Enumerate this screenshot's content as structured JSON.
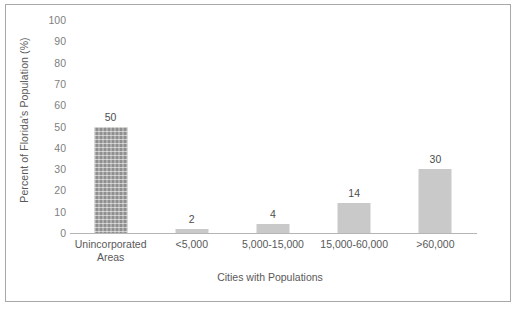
{
  "chart_data": {
    "type": "bar",
    "title": "",
    "subtitle": "",
    "xlabel": "Cities with Populations",
    "ylabel": "Percent of Florida's Population (%)",
    "categories": [
      "Unincorporated Areas",
      "<5,000",
      "5,000-15,000",
      "15,000-60,000",
      ">60,000"
    ],
    "category_lines": [
      [
        "Unincorporated",
        "Areas"
      ],
      [
        "<5,000"
      ],
      [
        "5,000-15,000"
      ],
      [
        "15,000-60,000"
      ],
      [
        ">60,000"
      ]
    ],
    "values": [
      50,
      2,
      4,
      14,
      30
    ],
    "data_labels": [
      "50",
      "2",
      "4",
      "14",
      "30"
    ],
    "ylim": [
      0,
      100
    ],
    "ytick_values": [
      100,
      90,
      80,
      70,
      60,
      50,
      40,
      30,
      20,
      10,
      0
    ],
    "ytick_labels": [
      "100",
      "90",
      "80",
      "70",
      "60",
      "50",
      "40",
      "30",
      "20",
      "10",
      "0"
    ],
    "grid": false,
    "legend": false,
    "bar_colors": [
      "#8f8f8f",
      "#c9c9c9",
      "#c9c9c9",
      "#c9c9c9",
      "#c9c9c9"
    ],
    "bar_patterns": [
      "crosshatch-grid",
      "solid",
      "solid",
      "solid",
      "solid"
    ],
    "axis_color": "#b5b5b5",
    "text_color": "#595959",
    "border_color": "#a8a8a8",
    "background": "#ffffff"
  }
}
